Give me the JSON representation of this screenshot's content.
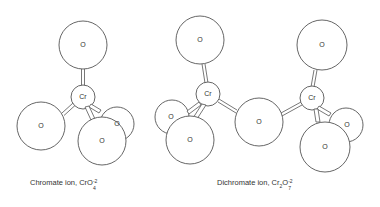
{
  "diagram": {
    "type": "molecular-structure",
    "structures": [
      {
        "name": "chromate",
        "caption": {
          "text": "Chromate ion, ",
          "formula_base": "CrO",
          "formula_sub": "4",
          "formula_sup": "-2"
        },
        "atoms": [
          {
            "id": "o-top",
            "label": "O",
            "cx": 83,
            "cy": 45,
            "r": 24
          },
          {
            "id": "o-left",
            "label": "O",
            "cx": 41,
            "cy": 126,
            "r": 24
          },
          {
            "id": "o-back-right",
            "label": "O",
            "cx": 117,
            "cy": 124,
            "r": 17
          },
          {
            "id": "cr",
            "label": "Cr",
            "cx": 83,
            "cy": 97,
            "r": 12
          },
          {
            "id": "o-front",
            "label": "O",
            "cx": 102,
            "cy": 141,
            "r": 24
          }
        ]
      },
      {
        "name": "dichromate",
        "caption": {
          "text": "Dichromate ion, ",
          "formula_cr": "Cr",
          "formula_cr_sub": "2",
          "formula_o": "O",
          "formula_o_sub": "7",
          "formula_sup": "-2"
        },
        "atoms": [
          {
            "id": "o-top-left",
            "label": "O",
            "cx": 200,
            "cy": 40,
            "r": 24
          },
          {
            "id": "o-back-left",
            "label": "O",
            "cx": 172,
            "cy": 117,
            "r": 17
          },
          {
            "id": "cr-left",
            "label": "Cr",
            "cx": 208,
            "cy": 94,
            "r": 12
          },
          {
            "id": "o-front-left",
            "label": "O",
            "cx": 190,
            "cy": 140,
            "r": 24
          },
          {
            "id": "o-bridge",
            "label": "O",
            "cx": 259,
            "cy": 122,
            "r": 24
          },
          {
            "id": "o-top-right",
            "label": "O",
            "cx": 322,
            "cy": 45,
            "r": 25
          },
          {
            "id": "o-back-right",
            "label": "O",
            "cx": 346,
            "cy": 125,
            "r": 17
          },
          {
            "id": "cr-right",
            "label": "Cr",
            "cx": 312,
            "cy": 98,
            "r": 12
          },
          {
            "id": "o-front-right",
            "label": "O",
            "cx": 325,
            "cy": 147,
            "r": 25
          }
        ]
      }
    ]
  }
}
